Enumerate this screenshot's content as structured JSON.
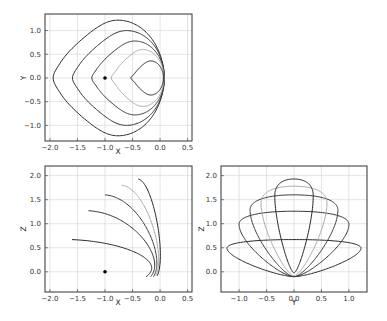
{
  "chart_data": [
    {
      "type": "line",
      "panel": "top-left",
      "xlabel": "X",
      "ylabel": "Y",
      "xlim": [
        -2.09,
        0.58
      ],
      "ylim": [
        -1.33,
        1.35
      ],
      "xticks": [
        "-2.0",
        "-1.5",
        "-1.0",
        "-0.5",
        "0.0",
        "0.5"
      ],
      "xtick_values": [
        -2.0,
        -1.5,
        -1.0,
        -0.5,
        0.0,
        0.5
      ],
      "yticks": [
        "-1.0",
        "-0.5",
        "0.0",
        "0.5",
        "1.0"
      ],
      "ytick_values": [
        -1.0,
        -0.5,
        0.0,
        0.5,
        1.0
      ],
      "grid": true,
      "marker_point": {
        "x": -1.0,
        "y": 0.0
      },
      "series": [
        {
          "name": "curve-1",
          "color": "#2a2a2a",
          "x_min": -1.6,
          "y_half": 1.22,
          "x_right": 0.07,
          "notch": 0.05
        },
        {
          "name": "curve-2",
          "color": "#333333",
          "x_min": -1.3,
          "y_half": 1.0,
          "x_right": 0.08,
          "notch": 0.05
        },
        {
          "name": "curve-3",
          "color": "#3a3a3a",
          "x_min": -1.0,
          "y_half": 0.78,
          "x_right": 0.08,
          "notch": 0.05
        },
        {
          "name": "curve-4",
          "color": "#aaaaaa",
          "x_min": -0.7,
          "y_half": 0.6,
          "x_right": 0.07,
          "notch": 0.05
        },
        {
          "name": "curve-5",
          "color": "#222222",
          "x_min": -0.4,
          "y_half": 0.36,
          "x_right": 0.06,
          "notch": 0.05
        }
      ]
    },
    {
      "type": "line",
      "panel": "bottom-left",
      "xlabel": "X",
      "ylabel": "Z",
      "xlim": [
        -2.09,
        0.58
      ],
      "ylim": [
        -0.42,
        2.2
      ],
      "xticks": [
        "-2.0",
        "-1.5",
        "-1.0",
        "-0.5",
        "0.0",
        "0.5"
      ],
      "xtick_values": [
        -2.0,
        -1.5,
        -1.0,
        -0.5,
        0.0,
        0.5
      ],
      "yticks": [
        "0.0",
        "0.5",
        "1.0",
        "1.5",
        "2.0"
      ],
      "ytick_values": [
        0.0,
        0.5,
        1.0,
        1.5,
        2.0
      ],
      "grid": true,
      "marker_point": {
        "x": -1.0,
        "z": 0.0
      },
      "series": [
        {
          "name": "curve-1",
          "color": "#2a2a2a",
          "start": [
            -1.6,
            0.67
          ],
          "end": [
            -0.25,
            -0.1
          ]
        },
        {
          "name": "curve-2",
          "color": "#333333",
          "start": [
            -1.3,
            1.27
          ],
          "end": [
            -0.17,
            -0.1
          ]
        },
        {
          "name": "curve-3",
          "color": "#3a3a3a",
          "start": [
            -1.0,
            1.6
          ],
          "end": [
            -0.12,
            -0.1
          ]
        },
        {
          "name": "curve-4",
          "color": "#aaaaaa",
          "start": [
            -0.7,
            1.8
          ],
          "end": [
            -0.08,
            -0.08
          ]
        },
        {
          "name": "curve-5",
          "color": "#222222",
          "start": [
            -0.4,
            1.93
          ],
          "end": [
            -0.05,
            -0.08
          ]
        }
      ]
    },
    {
      "type": "line",
      "panel": "bottom-right",
      "xlabel": "Y",
      "ylabel": "Z",
      "xlim": [
        -1.33,
        1.33
      ],
      "ylim": [
        -0.42,
        2.2
      ],
      "xticks": [
        "-1.0",
        "-0.5",
        "0.0",
        "0.5",
        "1.0"
      ],
      "xtick_values": [
        -1.0,
        -0.5,
        0.0,
        0.5,
        1.0
      ],
      "yticks": [
        "0.0",
        "0.5",
        "1.0",
        "1.5",
        "2.0"
      ],
      "ytick_values": [
        0.0,
        0.5,
        1.0,
        1.5,
        2.0
      ],
      "grid": true,
      "series": [
        {
          "name": "loop-1",
          "color": "#2a2a2a",
          "half_width": 1.22,
          "z_widest": 0.5,
          "z_top": 0.67,
          "z_bottom": -0.1
        },
        {
          "name": "loop-2",
          "color": "#333333",
          "half_width": 1.0,
          "z_widest": 1.0,
          "z_top": 1.26,
          "z_bottom": -0.1
        },
        {
          "name": "loop-3",
          "color": "#3a3a3a",
          "half_width": 0.8,
          "z_widest": 1.3,
          "z_top": 1.6,
          "z_bottom": -0.1
        },
        {
          "name": "loop-4",
          "color": "#aaaaaa",
          "half_width": 0.6,
          "z_widest": 1.45,
          "z_top": 1.78,
          "z_bottom": -0.08
        },
        {
          "name": "loop-5",
          "color": "#222222",
          "half_width": 0.35,
          "z_widest": 1.6,
          "z_top": 1.93,
          "z_bottom": -0.02
        }
      ]
    }
  ],
  "panels": {
    "top_left": {
      "xlabel": "X",
      "ylabel": "Y"
    },
    "bottom_left": {
      "xlabel": "X",
      "ylabel": "Z"
    },
    "bottom_right": {
      "xlabel": "Y",
      "ylabel": "Z"
    }
  }
}
